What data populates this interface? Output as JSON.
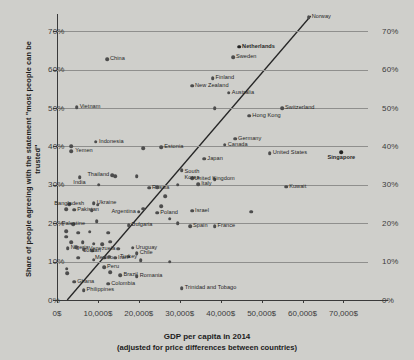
{
  "chart_data": {
    "type": "scatter",
    "title": "",
    "xlabel": "GDP per capita in 2014",
    "xlabel_sub": "(adjusted for price differences between countries)",
    "ylabel": "Share of people agreeing with the statement \"most people can be trusted\"",
    "xlim": [
      0,
      76000
    ],
    "ylim": [
      0,
      74
    ],
    "xticks": [
      "0$",
      "10,000$",
      "20,000$",
      "30,000$",
      "40,000$",
      "50,000$",
      "60,000$",
      "70,000$"
    ],
    "xtick_values": [
      0,
      10000,
      20000,
      30000,
      40000,
      50000,
      60000,
      70000
    ],
    "yticks": [
      "0%",
      "10%",
      "20%",
      "30%",
      "40%",
      "50%",
      "60%",
      "70%"
    ],
    "ytick_values": [
      0,
      10,
      20,
      30,
      40,
      50,
      60,
      70
    ],
    "grid": "horizontal",
    "legend": "none",
    "reference_line": {
      "type": "diagonal",
      "x0": 2500,
      "y0": 0,
      "x1": 62000,
      "y1": 74
    },
    "points": [
      {
        "label": "Norway",
        "x": 61500,
        "y": 73.7,
        "lx": 3,
        "ly": -3,
        "bold": false
      },
      {
        "label": "Netherlands",
        "x": 44500,
        "y": 66.0,
        "lx": 3,
        "ly": -3,
        "bold": true
      },
      {
        "label": "Sweden",
        "x": 43000,
        "y": 63.2,
        "lx": 3,
        "ly": -3,
        "bold": false
      },
      {
        "label": "China",
        "x": 12200,
        "y": 62.8,
        "lx": 3,
        "ly": -3,
        "bold": false
      },
      {
        "label": "Finland",
        "x": 38000,
        "y": 57.8,
        "lx": 3,
        "ly": -3,
        "bold": false
      },
      {
        "label": "New Zealand",
        "x": 33000,
        "y": 55.8,
        "lx": 3,
        "ly": -3,
        "bold": false
      },
      {
        "label": "Australia",
        "x": 42000,
        "y": 54.0,
        "lx": 3,
        "ly": -3,
        "bold": false
      },
      {
        "label": "Vietnam",
        "x": 4800,
        "y": 50.2,
        "lx": 3,
        "ly": -3,
        "bold": false
      },
      {
        "label": "Switzerland",
        "x": 55000,
        "y": 50.0,
        "lx": 3,
        "ly": -3,
        "bold": false
      },
      {
        "label": "",
        "x": 38500,
        "y": 50.0,
        "lx": 0,
        "ly": 0,
        "bold": false
      },
      {
        "label": "Hong Kong",
        "x": 47000,
        "y": 48.0,
        "lx": 3,
        "ly": -3,
        "bold": false
      },
      {
        "label": "Indonesia",
        "x": 9500,
        "y": 41.2,
        "lx": 3,
        "ly": -3,
        "bold": false
      },
      {
        "label": "Germany",
        "x": 43500,
        "y": 42.0,
        "lx": 3,
        "ly": -3,
        "bold": false
      },
      {
        "label": "Canada",
        "x": 41000,
        "y": 40.5,
        "lx": 3,
        "ly": -3,
        "bold": false
      },
      {
        "label": "Yemen",
        "x": 3500,
        "y": 38.8,
        "lx": 4,
        "ly": -3,
        "bold": false
      },
      {
        "label": "",
        "x": 3400,
        "y": 40.0,
        "lx": 0,
        "ly": 0,
        "bold": false
      },
      {
        "label": "Estonia",
        "x": 25500,
        "y": 39.8,
        "lx": 3,
        "ly": -3,
        "bold": false
      },
      {
        "label": "",
        "x": 21000,
        "y": 39.6,
        "lx": 0,
        "ly": 0,
        "bold": false
      },
      {
        "label": "United States",
        "x": 52000,
        "y": 38.3,
        "lx": 3,
        "ly": -3,
        "bold": false
      },
      {
        "label": "Singapore",
        "x": 69500,
        "y": 38.5,
        "lx": 0,
        "ly": 3,
        "bold": true,
        "center": true
      },
      {
        "label": "Japan",
        "x": 36000,
        "y": 36.8,
        "lx": 3,
        "ly": -3,
        "bold": false
      },
      {
        "label": "",
        "x": 30500,
        "y": 33.8,
        "lx": 0,
        "ly": 0,
        "bold": false
      },
      {
        "label": "Thailand",
        "x": 13500,
        "y": 32.5,
        "lx": -3,
        "ly": -3,
        "bold": false,
        "right": true
      },
      {
        "label": "",
        "x": 14200,
        "y": 32.3,
        "lx": 0,
        "ly": 0,
        "bold": false
      },
      {
        "label": "India",
        "x": 5500,
        "y": 32.0,
        "lx": 0,
        "ly": 3,
        "bold": false,
        "center": true
      },
      {
        "label": "",
        "x": 19500,
        "y": 32.2,
        "lx": 0,
        "ly": 0,
        "bold": false
      },
      {
        "label": "South Korea",
        "x": 33000,
        "y": 31.8,
        "lx": 0,
        "ly": -9,
        "bold": false,
        "center": true,
        "two": true
      },
      {
        "label": "United Kingdom",
        "x": 38500,
        "y": 31.5,
        "lx": 0,
        "ly": -3,
        "bold": false,
        "center": true
      },
      {
        "label": "Italy",
        "x": 34500,
        "y": 30.2,
        "lx": 3,
        "ly": -3,
        "bold": false
      },
      {
        "label": "",
        "x": 29500,
        "y": 30.0,
        "lx": 0,
        "ly": 0,
        "bold": false
      },
      {
        "label": "",
        "x": 10200,
        "y": 30.0,
        "lx": 0,
        "ly": 0,
        "bold": false
      },
      {
        "label": "Russia",
        "x": 22500,
        "y": 29.3,
        "lx": 3,
        "ly": -3,
        "bold": false
      },
      {
        "label": "",
        "x": 24500,
        "y": 29.4,
        "lx": 0,
        "ly": 0,
        "bold": false
      },
      {
        "label": "Kuwait",
        "x": 56000,
        "y": 29.5,
        "lx": 3,
        "ly": -3,
        "bold": false
      },
      {
        "label": "",
        "x": 26500,
        "y": 27.0,
        "lx": 0,
        "ly": 0,
        "bold": false
      },
      {
        "label": "Ukraine",
        "x": 9000,
        "y": 25.2,
        "lx": 3,
        "ly": -3,
        "bold": false
      },
      {
        "label": "Bangladesh",
        "x": 3000,
        "y": 25.0,
        "lx": 0,
        "ly": -3,
        "bold": false,
        "center": true
      },
      {
        "label": "",
        "x": 9900,
        "y": 24.8,
        "lx": 0,
        "ly": 0,
        "bold": false
      },
      {
        "label": "Pakistan",
        "x": 4200,
        "y": 23.5,
        "lx": 3,
        "ly": -3,
        "bold": false
      },
      {
        "label": "",
        "x": 2300,
        "y": 23.6,
        "lx": 0,
        "ly": 0,
        "bold": false
      },
      {
        "label": "",
        "x": 8500,
        "y": 23.4,
        "lx": 0,
        "ly": 0,
        "bold": false
      },
      {
        "label": "Argentina",
        "x": 20000,
        "y": 23.0,
        "lx": -3,
        "ly": -3,
        "bold": false,
        "right": true
      },
      {
        "label": "",
        "x": 21000,
        "y": 23.8,
        "lx": 0,
        "ly": 0,
        "bold": false
      },
      {
        "label": "",
        "x": 25500,
        "y": 24.5,
        "lx": 0,
        "ly": 0,
        "bold": false
      },
      {
        "label": "Poland",
        "x": 24500,
        "y": 22.7,
        "lx": 3,
        "ly": -3,
        "bold": false
      },
      {
        "label": "Israel",
        "x": 33000,
        "y": 23.3,
        "lx": 3,
        "ly": -3,
        "bold": false
      },
      {
        "label": "",
        "x": 47500,
        "y": 23.0,
        "lx": 0,
        "ly": 0,
        "bold": false
      },
      {
        "label": "",
        "x": 9700,
        "y": 20.5,
        "lx": 0,
        "ly": 0,
        "bold": false
      },
      {
        "label": "",
        "x": 27500,
        "y": 21.2,
        "lx": 0,
        "ly": 0,
        "bold": false
      },
      {
        "label": "Palestine",
        "x": 4000,
        "y": 19.8,
        "lx": 0,
        "ly": -3,
        "bold": false,
        "center": true
      },
      {
        "label": "Bulgaria",
        "x": 17500,
        "y": 19.5,
        "lx": 3,
        "ly": -3,
        "bold": false
      },
      {
        "label": "Spain",
        "x": 32500,
        "y": 19.2,
        "lx": 3,
        "ly": -3,
        "bold": false
      },
      {
        "label": "France",
        "x": 38500,
        "y": 19.2,
        "lx": 3,
        "ly": -3,
        "bold": false
      },
      {
        "label": "",
        "x": 29500,
        "y": 20.0,
        "lx": 0,
        "ly": 0,
        "bold": false
      },
      {
        "label": "",
        "x": 2200,
        "y": 18.0,
        "lx": 0,
        "ly": 0,
        "bold": false
      },
      {
        "label": "",
        "x": 2300,
        "y": 16.5,
        "lx": 0,
        "ly": 0,
        "bold": false
      },
      {
        "label": "",
        "x": 5200,
        "y": 17.5,
        "lx": 0,
        "ly": 0,
        "bold": false
      },
      {
        "label": "",
        "x": 8000,
        "y": 17.8,
        "lx": 0,
        "ly": 0,
        "bold": false
      },
      {
        "label": "",
        "x": 12500,
        "y": 17.5,
        "lx": 0,
        "ly": 0,
        "bold": false
      },
      {
        "label": "",
        "x": 3400,
        "y": 15.0,
        "lx": 0,
        "ly": 0,
        "bold": false
      },
      {
        "label": "",
        "x": 6300,
        "y": 15.0,
        "lx": 0,
        "ly": 0,
        "bold": false
      },
      {
        "label": "",
        "x": 9000,
        "y": 14.7,
        "lx": 0,
        "ly": 0,
        "bold": false
      },
      {
        "label": "",
        "x": 11000,
        "y": 14.5,
        "lx": 0,
        "ly": 0,
        "bold": false
      },
      {
        "label": "",
        "x": 13000,
        "y": 15.2,
        "lx": 0,
        "ly": 0,
        "bold": false
      },
      {
        "label": "Nigeria",
        "x": 2600,
        "y": 13.5,
        "lx": 3,
        "ly": -3,
        "bold": false
      },
      {
        "label": "",
        "x": 4700,
        "y": 13.8,
        "lx": 0,
        "ly": 0,
        "bold": false
      },
      {
        "label": "",
        "x": 6500,
        "y": 13.2,
        "lx": 0,
        "ly": 0,
        "bold": false
      },
      {
        "label": "Jordan",
        "x": 8600,
        "y": 12.8,
        "lx": 0,
        "ly": -3,
        "bold": false,
        "center": true
      },
      {
        "label": "Venezuela",
        "x": 15000,
        "y": 13.4,
        "lx": -3,
        "ly": -3,
        "bold": false,
        "right": true
      },
      {
        "label": "Uruguay",
        "x": 18500,
        "y": 13.6,
        "lx": 3,
        "ly": -3,
        "bold": false
      },
      {
        "label": "Chile",
        "x": 19500,
        "y": 12.2,
        "lx": 3,
        "ly": -3,
        "bold": false
      },
      {
        "label": "Turkey",
        "x": 17500,
        "y": 11.3,
        "lx": 0,
        "ly": -3,
        "bold": false,
        "center": true
      },
      {
        "label": "Mexico",
        "x": 11500,
        "y": 11.0,
        "lx": 0,
        "ly": -3,
        "bold": false,
        "center": true
      },
      {
        "label": "Iran",
        "x": 14200,
        "y": 11.0,
        "lx": 3,
        "ly": -3,
        "bold": false
      },
      {
        "label": "",
        "x": 12800,
        "y": 11.3,
        "lx": 0,
        "ly": 0,
        "bold": false
      },
      {
        "label": "",
        "x": 5200,
        "y": 11.0,
        "lx": 0,
        "ly": 0,
        "bold": false
      },
      {
        "label": "",
        "x": 9000,
        "y": 10.5,
        "lx": 0,
        "ly": 0,
        "bold": false
      },
      {
        "label": "",
        "x": 20500,
        "y": 10.3,
        "lx": 0,
        "ly": 0,
        "bold": false
      },
      {
        "label": "",
        "x": 27500,
        "y": 10.0,
        "lx": 0,
        "ly": 0,
        "bold": false
      },
      {
        "label": "Peru",
        "x": 11500,
        "y": 8.6,
        "lx": 3,
        "ly": -3,
        "bold": false
      },
      {
        "label": "",
        "x": 2400,
        "y": 8.2,
        "lx": 0,
        "ly": 0,
        "bold": false
      },
      {
        "label": "",
        "x": 2500,
        "y": 7.0,
        "lx": 0,
        "ly": 0,
        "bold": false
      },
      {
        "label": "",
        "x": 13000,
        "y": 7.2,
        "lx": 0,
        "ly": 0,
        "bold": false
      },
      {
        "label": "Brazil",
        "x": 15500,
        "y": 6.4,
        "lx": 3,
        "ly": -3,
        "bold": false
      },
      {
        "label": "Romania",
        "x": 19500,
        "y": 6.2,
        "lx": 3,
        "ly": -3,
        "bold": false
      },
      {
        "label": "Ghana",
        "x": 4200,
        "y": 4.8,
        "lx": 3,
        "ly": -3,
        "bold": false
      },
      {
        "label": "Colombia",
        "x": 12500,
        "y": 4.2,
        "lx": 3,
        "ly": -3,
        "bold": false
      },
      {
        "label": "Philippines",
        "x": 6500,
        "y": 2.6,
        "lx": 3,
        "ly": -3,
        "bold": false
      },
      {
        "label": "Trinidad and Tobago",
        "x": 30500,
        "y": 3.0,
        "lx": 3,
        "ly": -3,
        "bold": false
      }
    ]
  }
}
